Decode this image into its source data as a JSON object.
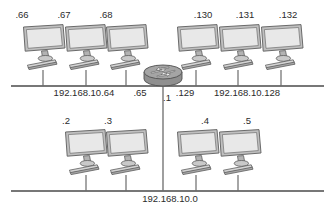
{
  "diagram": {
    "colors": {
      "line": "#4a4a4a",
      "monitor_body": "#bfbfbf",
      "monitor_screen": "#e8e8e8",
      "router_body": "#8f8f8f",
      "text": "#2b2b2b",
      "background": "#ffffff"
    },
    "top_bus": {
      "left_segment_label": "192.168.10.64",
      "right_segment_label": "192.168.10.128",
      "router_left_interface": ".65",
      "router_right_interface": ".129"
    },
    "bottom_bus": {
      "label": "192.168.10.0",
      "router_interface": ".1"
    },
    "router": {
      "name": "router",
      "icon": "router-icon"
    },
    "hosts_top_left": [
      {
        "label": ".66",
        "icon": "computer-icon"
      },
      {
        "label": ".67",
        "icon": "computer-icon"
      },
      {
        "label": ".68",
        "icon": "computer-icon"
      }
    ],
    "hosts_top_right": [
      {
        "label": ".130",
        "icon": "computer-icon"
      },
      {
        "label": ".131",
        "icon": "computer-icon"
      },
      {
        "label": ".132",
        "icon": "computer-icon"
      }
    ],
    "hosts_bottom_left": [
      {
        "label": ".2",
        "icon": "computer-icon"
      },
      {
        "label": ".3",
        "icon": "computer-icon"
      }
    ],
    "hosts_bottom_right": [
      {
        "label": ".4",
        "icon": "computer-icon"
      },
      {
        "label": ".5",
        "icon": "computer-icon"
      }
    ]
  }
}
